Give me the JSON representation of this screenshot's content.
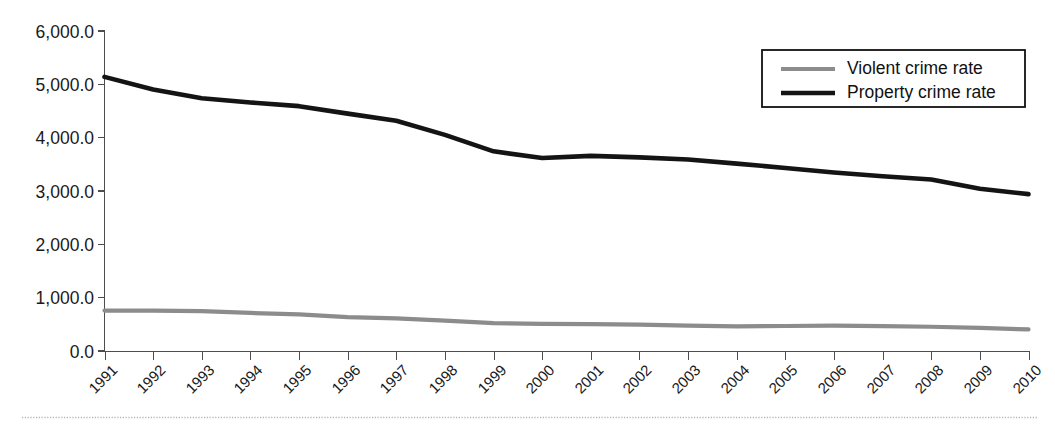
{
  "chart_data": {
    "type": "line",
    "title": "",
    "xlabel": "",
    "ylabel": "",
    "ylim": [
      0,
      6000
    ],
    "ytick_step": 1000,
    "grid": false,
    "legend_position": "top-right",
    "categories": [
      "1991",
      "1992",
      "1993",
      "1994",
      "1995",
      "1996",
      "1997",
      "1998",
      "1999",
      "2000",
      "2001",
      "2002",
      "2003",
      "2004",
      "2005",
      "2006",
      "2007",
      "2008",
      "2009",
      "2010"
    ],
    "ytick_labels": [
      "0.0",
      "1,000.0",
      "2,000.0",
      "3,000.0",
      "4,000.0",
      "5,000.0",
      "6,000.0"
    ],
    "ytick_values": [
      0,
      1000,
      2000,
      3000,
      4000,
      5000,
      6000
    ],
    "series": [
      {
        "name": "Violent crime rate",
        "color": "#8c8c8c",
        "width": 4.2,
        "values": [
          758,
          757,
          747,
          714,
          685,
          637,
          611,
          568,
          523,
          507,
          505,
          495,
          476,
          463,
          469,
          474,
          467,
          455,
          432,
          405
        ]
      },
      {
        "name": "Property crime rate",
        "color": "#141414",
        "width": 4.6,
        "values": [
          5140,
          4903,
          4740,
          4660,
          4591,
          4451,
          4316,
          4053,
          3744,
          3618,
          3658,
          3631,
          3591,
          3514,
          3432,
          3347,
          3276,
          3215,
          3041,
          2941
        ]
      }
    ]
  },
  "legend": {
    "items": [
      {
        "label": "Violent crime rate",
        "color": "#8c8c8c",
        "width": 4.2
      },
      {
        "label": "Property crime rate",
        "color": "#141414",
        "width": 4.6
      }
    ]
  },
  "axes": {
    "x_label_rotation": -45
  }
}
